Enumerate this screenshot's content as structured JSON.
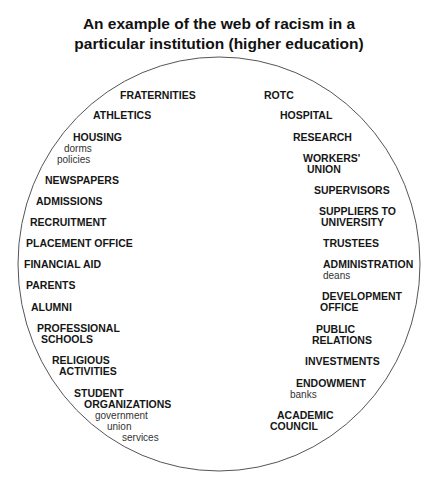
{
  "title": {
    "line1": "An example of the web of racism in a",
    "line2": "particular institution (higher education)"
  },
  "left": {
    "fraternities": "FRATERNITIES",
    "athletics": "ATHLETICS",
    "housing": "HOUSING",
    "housing_sub1": "dorms",
    "housing_sub2": "policies",
    "newspapers": "NEWSPAPERS",
    "admissions": "ADMISSIONS",
    "recruitment": "RECRUITMENT",
    "placement_office": "PLACEMENT OFFICE",
    "financial_aid": "FINANCIAL AID",
    "parents": "PARENTS",
    "alumni": "ALUMNI",
    "professional_1": "PROFESSIONAL",
    "professional_2": "SCHOOLS",
    "religious_1": "RELIGIOUS",
    "religious_2": "ACTIVITIES",
    "student_1": "STUDENT",
    "student_2": "ORGANIZATIONS",
    "student_sub1": "government",
    "student_sub2": "union",
    "student_sub3": "services"
  },
  "right": {
    "rotc": "ROTC",
    "hospital": "HOSPITAL",
    "research": "RESEARCH",
    "workers_1": "WORKERS'",
    "workers_2": "UNION",
    "supervisors": "SUPERVISORS",
    "suppliers_1": "SUPPLIERS TO",
    "suppliers_2": "UNIVERSITY",
    "trustees": "TRUSTEES",
    "administration": "ADMINISTRATION",
    "administration_sub": "deans",
    "development_1": "DEVELOPMENT",
    "development_2": "OFFICE",
    "public_1": "PUBLIC",
    "public_2": "RELATIONS",
    "investments": "INVESTMENTS",
    "endowment": "ENDOWMENT",
    "endowment_sub": "banks",
    "academic_1": "ACADEMIC",
    "academic_2": "COUNCIL"
  }
}
